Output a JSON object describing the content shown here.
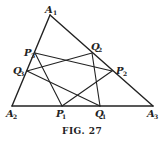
{
  "figure": {
    "caption": "Fig. 27",
    "caption_display": "FIG. 27",
    "points": {
      "A1": {
        "label": "A",
        "sub": "1",
        "x": 50,
        "y": 15
      },
      "A2": {
        "label": "A",
        "sub": "2",
        "x": 12,
        "y": 106
      },
      "A3": {
        "label": "A",
        "sub": "3",
        "x": 153,
        "y": 106
      },
      "P1": {
        "label": "P",
        "sub": "1",
        "x": 62,
        "y": 106
      },
      "Q1": {
        "label": "Q",
        "sub": "1",
        "x": 100,
        "y": 106
      },
      "P2": {
        "label": "P",
        "sub": "2",
        "x": 112,
        "y": 71
      },
      "Q2": {
        "label": "Q",
        "sub": "2",
        "x": 92,
        "y": 53
      },
      "P3": {
        "label": "P",
        "sub": "3",
        "x": 35,
        "y": 53
      },
      "Q3": {
        "label": "Q",
        "sub": "3",
        "x": 27,
        "y": 71
      }
    },
    "triangle": [
      "A1",
      "A2",
      "A3"
    ],
    "segments": [
      [
        "P3",
        "P2"
      ],
      [
        "Q3",
        "Q2"
      ],
      [
        "P3",
        "P1"
      ],
      [
        "Q3",
        "Q1"
      ],
      [
        "Q2",
        "Q1"
      ],
      [
        "P2",
        "P1"
      ]
    ],
    "stroke_color": "#222222",
    "background": "#ffffff"
  }
}
